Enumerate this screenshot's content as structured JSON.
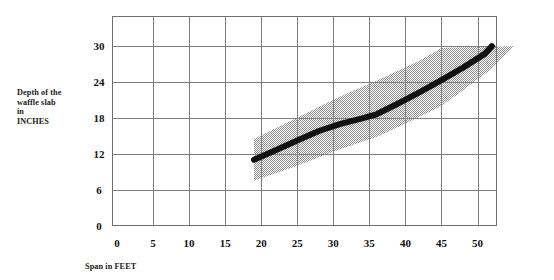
{
  "chart_data": {
    "type": "line",
    "title": "",
    "subtitle": "",
    "xlabel": "Span in FEET",
    "ylabel_lines": [
      "Depth of the",
      "waffle slab",
      "in",
      "INCHES"
    ],
    "ylabel": "Depth of the waffle slab in INCHES",
    "xlim": [
      0,
      55
    ],
    "ylim": [
      0,
      33
    ],
    "xticks": [
      0,
      5,
      10,
      15,
      20,
      25,
      30,
      35,
      40,
      45,
      50
    ],
    "yticks": [
      0,
      6,
      12,
      18,
      24,
      30
    ],
    "xtick_labels": [
      "0",
      "5",
      "10",
      "15",
      "20",
      "25",
      "30",
      "35",
      "40",
      "45",
      "50"
    ],
    "ytick_labels": [
      "0",
      "6",
      "12",
      "18",
      "24",
      "30"
    ],
    "grid": true,
    "grid_color": "#808080",
    "legend": "none",
    "series": [
      {
        "name": "Typical waffle slab depth",
        "type": "line",
        "color": "#111111",
        "linewidth_px": 6,
        "x": [
          19,
          22,
          25,
          28,
          31,
          34,
          36,
          39,
          42,
          45,
          48,
          51,
          52
        ],
        "values": [
          11,
          12.6,
          14.2,
          15.8,
          17.0,
          17.9,
          18.6,
          20.4,
          22.3,
          24.3,
          26.4,
          28.7,
          30
        ]
      },
      {
        "name": "Range band upper bound",
        "type": "band-upper",
        "color": "#b3b3b3",
        "x": [
          19,
          25,
          31,
          36,
          42,
          45,
          48,
          52,
          55
        ],
        "values": [
          14.5,
          18.0,
          21.6,
          24.2,
          27.6,
          29.7,
          29.8,
          29.9,
          30.0
        ]
      },
      {
        "name": "Range band lower bound",
        "type": "band-lower",
        "color": "#b3b3b3",
        "x": [
          19,
          25,
          31,
          36,
          42,
          45,
          48,
          52,
          55
        ],
        "values": [
          7.5,
          10.0,
          12.8,
          14.8,
          18.2,
          20.0,
          22.6,
          26.2,
          30.0
        ]
      }
    ],
    "annotations": []
  },
  "colors": {
    "background": "#ffffff",
    "grid": "#808080",
    "curve": "#111111",
    "band_fill": "#b0b0b0",
    "text": "#111111"
  }
}
